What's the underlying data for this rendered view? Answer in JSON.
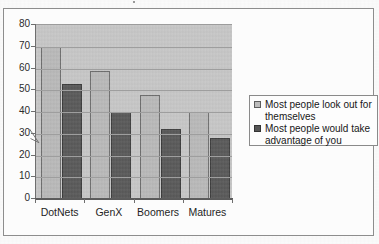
{
  "page": {
    "top_fragment": "",
    "frame_border_color": "#8d8d8d"
  },
  "chart_data": {
    "type": "bar",
    "title": "",
    "subtitle": "",
    "xlabel": "",
    "ylabel": "",
    "categories": [
      "DotNets",
      "GenX",
      "Boomers",
      "Matures"
    ],
    "series": [
      {
        "name": "Most people look out for themselves",
        "values": [
          70,
          59,
          48,
          40
        ],
        "color": "#b9b9b9"
      },
      {
        "name": "Most people would take advantage of you",
        "values": [
          53,
          40,
          32,
          28
        ],
        "color": "#585858"
      }
    ],
    "ylim": [
      0,
      80
    ],
    "ytick_step": 10,
    "yticks": [
      80,
      70,
      60,
      50,
      40,
      30,
      20,
      10,
      0
    ],
    "grid": true,
    "grid_axis": "y",
    "legend_position": "right",
    "plot_background": "#c7c7c7"
  },
  "legend": {
    "entries": [
      {
        "label": "Most people look out for themselves",
        "swatch": "legend-swatch-light"
      },
      {
        "label": "Most people would take advantage of you",
        "swatch": "legend-swatch-dark"
      }
    ]
  },
  "annotations": {
    "pen_mark": "diagonal-pen-stroke-near-34"
  }
}
